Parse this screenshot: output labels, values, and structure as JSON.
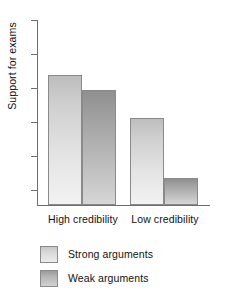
{
  "chart_data": {
    "type": "bar",
    "title": "",
    "subtitle": "",
    "xlabel": "",
    "ylabel": "Support for exams",
    "categories": [
      "High credibility",
      "Low credibility"
    ],
    "series": [
      {
        "name": "Strong arguments",
        "values": [
          131,
          87
        ],
        "color": "#dcdcdc"
      },
      {
        "name": "Weak arguments",
        "values": [
          116,
          27
        ],
        "color": "#aeaeae"
      }
    ],
    "ylim": [
      0,
      186
    ],
    "y_tick_count": 6,
    "y_tick_labels": [
      "",
      "",
      "",
      "",
      "",
      ""
    ],
    "grid": false,
    "legend_position": "bottom-left",
    "annotations": [],
    "axis_color": "#6e6e6e",
    "bar_border_color": "#8a8a8a",
    "background": "#ffffff"
  },
  "legend": {
    "items": [
      {
        "label": "Strong arguments",
        "swatch": "strong"
      },
      {
        "label": "Weak arguments",
        "swatch": "weak"
      }
    ]
  },
  "axis": {
    "y_label": "Support for exams"
  },
  "categories": {
    "first": "High credibility",
    "second": "Low credibility"
  }
}
